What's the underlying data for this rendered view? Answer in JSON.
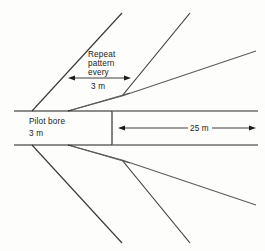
{
  "diagram": {
    "background_color": "#fdfdfc",
    "labels": {
      "repeat_line1": "Repeat",
      "repeat_line2": "pattern",
      "repeat_line3": "every",
      "repeat_value": "3 m",
      "pilot_bore_name": "Pilot bore",
      "pilot_bore_value": "3 m",
      "tunnel_length": "25 m"
    },
    "dimensions": {
      "repeat_spacing": "3 m",
      "pilot_bore_diameter": "3 m",
      "tunnel_reach": "25 m"
    },
    "colors": {
      "fan_line": "#5c5c5c",
      "fan_line_dark": "#3a3a3a",
      "bore_outline": "#1c1c1c",
      "tunnel_wall": "#6e6e6e",
      "arrow": "#1c1c1c",
      "text": "#1a1a1a"
    },
    "geometry": {
      "bore_top_y": 111,
      "bore_bottom_y": 145,
      "bore_left_x": 14,
      "bore_right_x": 112,
      "apex_upper": {
        "x": 122,
        "y": 96
      },
      "apex_lower": {
        "x": 122,
        "y": 160
      },
      "tunnel_top_y": 111,
      "tunnel_bottom_y": 145,
      "tunnel_right_x": 258
    },
    "fan_upper": [
      {
        "name": "upper-fan-line-1",
        "x1": 32,
        "y1": 111,
        "x2": 122,
        "y2": 13
      },
      {
        "name": "upper-fan-line-2",
        "x1": 68,
        "y1": 111,
        "x2": 122,
        "y2": 96
      },
      {
        "name": "upper-fan-line-3",
        "x1": 122,
        "y1": 96,
        "x2": 190,
        "y2": 13
      },
      {
        "name": "upper-fan-line-4",
        "x1": 122,
        "y1": 96,
        "x2": 256,
        "y2": 51
      }
    ],
    "fan_lower": [
      {
        "name": "lower-fan-line-1",
        "x1": 32,
        "y1": 145,
        "x2": 122,
        "y2": 243
      },
      {
        "name": "lower-fan-line-2",
        "x1": 68,
        "y1": 145,
        "x2": 122,
        "y2": 160
      },
      {
        "name": "lower-fan-line-3",
        "x1": 122,
        "y1": 160,
        "x2": 190,
        "y2": 243
      },
      {
        "name": "lower-fan-line-4",
        "x1": 122,
        "y1": 160,
        "x2": 256,
        "y2": 205
      }
    ],
    "dimension_arrows": [
      {
        "name": "repeat-pattern-arrow",
        "x1": 68,
        "x2": 131,
        "y": 78,
        "double_headed": true,
        "label": "3 m"
      },
      {
        "name": "tunnel-length-arrow",
        "x1": 118,
        "x2": 256,
        "y": 128,
        "double_headed": true,
        "label": "25 m"
      }
    ]
  }
}
